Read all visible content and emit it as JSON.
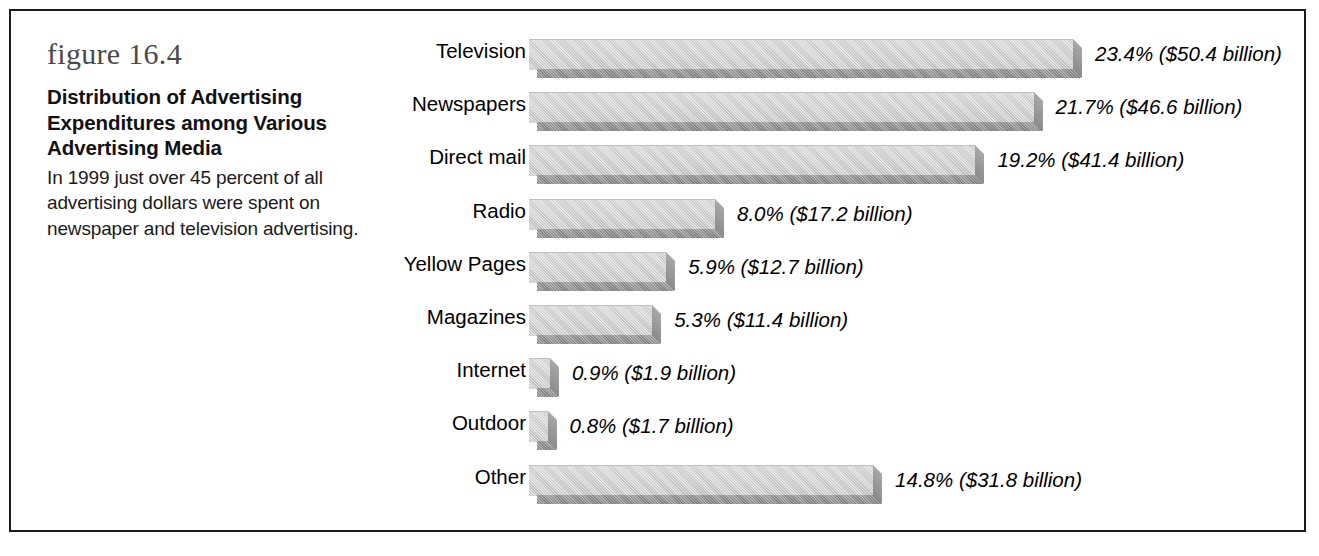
{
  "figure": {
    "number_label": "figure 16.4",
    "title": "Distribution of Advertising Expenditures among Various Advertising Media",
    "description": "In 1999 just over 45 percent of all advertising dollars were spent on newspaper and television advertising."
  },
  "chart_data": {
    "type": "bar",
    "orientation": "horizontal",
    "title": "Distribution of Advertising Expenditures among Various Advertising Media",
    "xlabel": "",
    "ylabel": "",
    "xlim": [
      0,
      25
    ],
    "grid": false,
    "legend": "none",
    "unit": "percent of total advertising expenditures",
    "categories": [
      "Television",
      "Newspapers",
      "Direct mail",
      "Radio",
      "Yellow Pages",
      "Magazines",
      "Internet",
      "Outdoor",
      "Other"
    ],
    "values": [
      23.4,
      21.7,
      19.2,
      8.0,
      5.9,
      5.3,
      0.9,
      0.8,
      14.8
    ],
    "dollars_billion": [
      50.4,
      46.6,
      41.4,
      17.2,
      12.7,
      11.4,
      1.9,
      1.7,
      31.8
    ],
    "data_labels": [
      "23.4% ($50.4 billion)",
      "21.7% ($46.6 billion)",
      "19.2% ($41.4 billion)",
      "8.0% ($17.2 billion)",
      "5.9% ($12.7 billion)",
      "5.3% ($11.4 billion)",
      "0.9% ($1.9 billion)",
      "0.8% ($1.7 billion)",
      "14.8% ($31.8 billion)"
    ]
  },
  "style": {
    "bar_face_color": "#c6c6c6",
    "bar_shadow_color": "#808080",
    "frame_color": "#1c1c1c",
    "text_color": "#000000",
    "figure_number_color": "#4a4a4a",
    "background": "#ffffff"
  }
}
